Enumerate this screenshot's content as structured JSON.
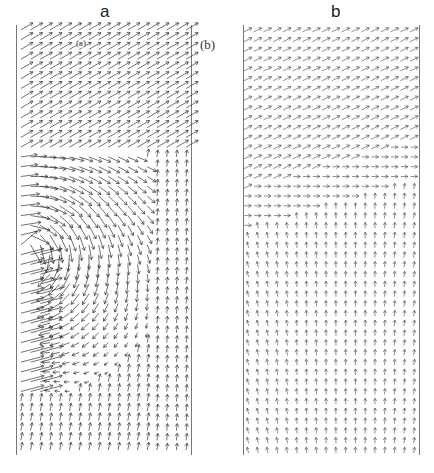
{
  "figure": {
    "panels": [
      {
        "id": "a",
        "title": "a",
        "inset_label": "(a)",
        "description": "Vector field with a vortex/separation region near lower-left wall; diagonal flow in upper part, near-vertical flow in lower right",
        "frame": {
          "left": 16,
          "right": 191,
          "top": 25,
          "bottom": 455
        },
        "grid": {
          "cols": 18,
          "rows": 44
        },
        "arrow_color": "#333333"
      },
      {
        "id": "b",
        "title": "b",
        "side_label": "(b)",
        "description": "Uniform diagonal vector field in upper third transitioning to near-vertical short arrows in lower two-thirds",
        "frame": {
          "left": 243,
          "right": 419,
          "top": 25,
          "bottom": 455
        },
        "grid": {
          "cols": 18,
          "rows": 44
        },
        "arrow_color": "#444444"
      }
    ],
    "border_color": "#777777"
  }
}
